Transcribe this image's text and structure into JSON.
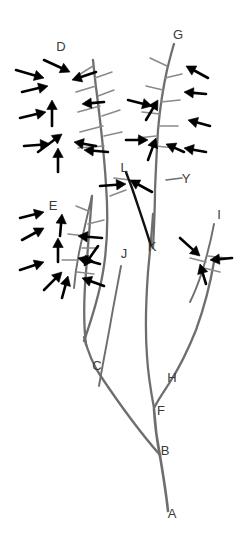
{
  "figure": {
    "background_color": "#ffffff",
    "width": 252,
    "height": 549,
    "stem_color": "#6e6e6e",
    "twig_color": "#8a8a8a",
    "arrow_color": "#000000",
    "highlight_branch_color": "#111111",
    "label_color": "#3a3a3a"
  },
  "labels": [
    {
      "id": "A",
      "text": "A",
      "x": 172,
      "y": 515,
      "description": "base of main stem"
    },
    {
      "id": "B",
      "text": "B",
      "x": 165,
      "y": 452,
      "description": "first branch junction above base"
    },
    {
      "id": "C",
      "text": "C",
      "x": 97,
      "y": 367,
      "description": "junction on left branch"
    },
    {
      "id": "D",
      "text": "D",
      "x": 61,
      "y": 48,
      "description": "apex of upper-left branch cluster"
    },
    {
      "id": "E",
      "text": "E",
      "x": 53,
      "y": 207,
      "description": "apex of lower-left branch cluster"
    },
    {
      "id": "F",
      "text": "F",
      "x": 161,
      "y": 412,
      "description": "junction above B on central stem"
    },
    {
      "id": "G",
      "text": "G",
      "x": 178,
      "y": 36,
      "description": "apex of upper-right branch cluster"
    },
    {
      "id": "H",
      "text": "H",
      "x": 172,
      "y": 379,
      "description": "junction on right branch"
    },
    {
      "id": "I",
      "text": "I",
      "x": 219,
      "y": 216,
      "description": "apex of right short cluster"
    },
    {
      "id": "J",
      "text": "J",
      "x": 124,
      "y": 255,
      "description": "lower tip of free stem"
    },
    {
      "id": "K",
      "text": "K",
      "x": 152,
      "y": 248,
      "description": "origin of highlighted dark branch"
    },
    {
      "id": "L",
      "text": "L",
      "x": 124,
      "y": 169,
      "description": "apex of highlighted dark branch"
    },
    {
      "id": "Y",
      "text": "Y",
      "x": 186,
      "y": 180,
      "description": "tick mark node on right central stem"
    }
  ],
  "stems": [
    {
      "name": "main-stem-A-to-B",
      "d": "M 168 511 C 166 492 163 474 160 456",
      "class": "stem-main"
    },
    {
      "name": "stem-B-to-F",
      "d": "M 160 456 C 157 441 155 426 154 409",
      "class": "stem-main"
    },
    {
      "name": "stem-B-to-C-branch",
      "d": "M 160 455 C 145 438 120 405 100 375 C 92 363 88 352 84 337",
      "class": "stem-major"
    },
    {
      "name": "stem-C-upper-left",
      "d": "M 86 345 C 83 320 84 296 86 272 C 88 248 90 220 92 196",
      "class": "stem-major"
    },
    {
      "name": "stem-C-to-D",
      "d": "M 84 341 C 92 318 99 296 103 272 C 108 243 108 212 106 185 C 104 150 100 120 97 95 C 95 80 94 70 93 60",
      "class": "stem-major"
    },
    {
      "name": "stem-F-to-H-branch",
      "d": "M 154 408 C 159 398 165 390 170 382 C 179 368 188 350 196 330 C 204 308 210 285 214 262",
      "class": "stem-major"
    },
    {
      "name": "stem-F-upper",
      "d": "M 154 408 C 151 392 148 374 147 356 C 145 330 146 300 148 272 C 150 250 152 232 153 214",
      "class": "stem-major"
    },
    {
      "name": "stem-K-to-G",
      "d": "M 153 248 C 154 228 155 208 155 190 C 156 166 157 146 158 130 C 160 108 163 88 167 70 C 170 58 172 50 174 44",
      "class": "stem-major"
    },
    {
      "name": "stem-J-free",
      "d": "M 121 266 C 117 288 113 308 110 326 C 106 348 102 368 99 386",
      "class": "stem-minor"
    },
    {
      "name": "stem-I-short",
      "d": "M 214 224 C 211 240 207 256 202 272 C 198 284 194 294 190 302",
      "class": "stem-minor"
    },
    {
      "name": "stem-E-branch",
      "d": "M 92 196 C 88 212 84 230 80 248 C 77 262 75 276 74 288",
      "class": "stem-minor"
    }
  ],
  "twigs": [
    {
      "name": "twig-d1",
      "d": "M 93 66 L 77 76"
    },
    {
      "name": "twig-d2",
      "d": "M 95 78 L 112 72"
    },
    {
      "name": "twig-d3",
      "d": "M 96 86 L 76 92"
    },
    {
      "name": "twig-d4",
      "d": "M 98 96 L 114 90"
    },
    {
      "name": "twig-d5",
      "d": "M 100 106 L 78 112"
    },
    {
      "name": "twig-d6",
      "d": "M 102 116 L 120 110"
    },
    {
      "name": "twig-d7",
      "d": "M 103 126 L 80 132"
    },
    {
      "name": "twig-d8",
      "d": "M 104 136 L 122 132"
    },
    {
      "name": "twig-d9",
      "d": "M 104 146 L 78 148"
    },
    {
      "name": "twig-g1",
      "d": "M 167 66 L 150 58"
    },
    {
      "name": "twig-g2",
      "d": "M 165 78 L 182 74"
    },
    {
      "name": "twig-g3",
      "d": "M 163 90 L 146 86"
    },
    {
      "name": "twig-g4",
      "d": "M 161 102 L 180 100"
    },
    {
      "name": "twig-g5",
      "d": "M 160 114 L 142 112"
    },
    {
      "name": "twig-g6",
      "d": "M 158 126 L 178 126"
    },
    {
      "name": "twig-g7",
      "d": "M 156 136 L 138 138"
    },
    {
      "name": "twig-g8",
      "d": "M 155 146 L 176 148"
    },
    {
      "name": "twig-e1",
      "d": "M 91 212 L 76 206"
    },
    {
      "name": "twig-e2",
      "d": "M 88 224 L 104 220"
    },
    {
      "name": "twig-e3",
      "d": "M 85 236 L 68 234"
    },
    {
      "name": "twig-e4",
      "d": "M 82 248 L 98 248"
    },
    {
      "name": "twig-e5",
      "d": "M 79 260 L 62 260"
    },
    {
      "name": "twig-e6",
      "d": "M 77 272 L 94 274"
    },
    {
      "name": "twig-i1",
      "d": "M 208 256 L 226 258"
    },
    {
      "name": "twig-i2",
      "d": "M 206 262 L 190 258"
    },
    {
      "name": "twig-i3",
      "d": "M 204 268 L 220 272"
    },
    {
      "name": "twig-l1",
      "d": "M 130 180 L 114 178"
    },
    {
      "name": "twig-l2",
      "d": "M 126 190 L 110 196"
    }
  ],
  "ticks": [
    {
      "name": "tick-y",
      "d": "M 166 180 L 182 178"
    }
  ],
  "highlight_branch": {
    "name": "branch-K-to-L",
    "d": "M 151 246 C 145 226 138 206 132 188 C 129 180 127 175 126 172"
  },
  "arrows": [
    {
      "name": "arrow-d-a",
      "x1": 16,
      "y1": 70,
      "x2": 44,
      "y2": 78
    },
    {
      "name": "arrow-d-b",
      "x1": 44,
      "y1": 60,
      "x2": 70,
      "y2": 72
    },
    {
      "name": "arrow-d-c",
      "x1": 96,
      "y1": 72,
      "x2": 72,
      "y2": 80
    },
    {
      "name": "arrow-d-d",
      "x1": 22,
      "y1": 92,
      "x2": 48,
      "y2": 86
    },
    {
      "name": "arrow-d-e",
      "x1": 104,
      "y1": 102,
      "x2": 82,
      "y2": 104
    },
    {
      "name": "arrow-d-f",
      "x1": 20,
      "y1": 118,
      "x2": 46,
      "y2": 112
    },
    {
      "name": "arrow-d-g",
      "x1": 52,
      "y1": 126,
      "x2": 52,
      "y2": 100
    },
    {
      "name": "arrow-d-h",
      "x1": 38,
      "y1": 152,
      "x2": 62,
      "y2": 134
    },
    {
      "name": "arrow-d-i",
      "x1": 24,
      "y1": 146,
      "x2": 50,
      "y2": 144
    },
    {
      "name": "arrow-d-j",
      "x1": 58,
      "y1": 172,
      "x2": 58,
      "y2": 148
    },
    {
      "name": "arrow-d-k",
      "x1": 96,
      "y1": 146,
      "x2": 74,
      "y2": 142
    },
    {
      "name": "arrow-d-l",
      "x1": 108,
      "y1": 152,
      "x2": 84,
      "y2": 150
    },
    {
      "name": "arrow-g-a",
      "x1": 208,
      "y1": 78,
      "x2": 186,
      "y2": 66
    },
    {
      "name": "arrow-g-b",
      "x1": 206,
      "y1": 94,
      "x2": 184,
      "y2": 92
    },
    {
      "name": "arrow-g-c",
      "x1": 128,
      "y1": 100,
      "x2": 152,
      "y2": 106
    },
    {
      "name": "arrow-g-d",
      "x1": 146,
      "y1": 120,
      "x2": 158,
      "y2": 100
    },
    {
      "name": "arrow-g-e",
      "x1": 210,
      "y1": 126,
      "x2": 188,
      "y2": 120
    },
    {
      "name": "arrow-g-f",
      "x1": 126,
      "y1": 140,
      "x2": 148,
      "y2": 140
    },
    {
      "name": "arrow-g-g",
      "x1": 148,
      "y1": 160,
      "x2": 156,
      "y2": 138
    },
    {
      "name": "arrow-g-h",
      "x1": 206,
      "y1": 152,
      "x2": 184,
      "y2": 148
    },
    {
      "name": "arrow-g-i",
      "x1": 184,
      "y1": 152,
      "x2": 166,
      "y2": 144
    },
    {
      "name": "arrow-e-a",
      "x1": 20,
      "y1": 218,
      "x2": 44,
      "y2": 212
    },
    {
      "name": "arrow-e-b",
      "x1": 60,
      "y1": 236,
      "x2": 62,
      "y2": 214
    },
    {
      "name": "arrow-e-c",
      "x1": 22,
      "y1": 240,
      "x2": 44,
      "y2": 228
    },
    {
      "name": "arrow-e-d",
      "x1": 102,
      "y1": 238,
      "x2": 78,
      "y2": 236
    },
    {
      "name": "arrow-e-e",
      "x1": 58,
      "y1": 262,
      "x2": 58,
      "y2": 238
    },
    {
      "name": "arrow-e-f",
      "x1": 100,
      "y1": 264,
      "x2": 78,
      "y2": 258
    },
    {
      "name": "arrow-e-g",
      "x1": 20,
      "y1": 270,
      "x2": 44,
      "y2": 262
    },
    {
      "name": "arrow-e-h",
      "x1": 98,
      "y1": 246,
      "x2": 84,
      "y2": 266
    },
    {
      "name": "arrow-e-i",
      "x1": 44,
      "y1": 290,
      "x2": 62,
      "y2": 272
    },
    {
      "name": "arrow-e-j",
      "x1": 62,
      "y1": 298,
      "x2": 68,
      "y2": 276
    },
    {
      "name": "arrow-e-k",
      "x1": 104,
      "y1": 286,
      "x2": 82,
      "y2": 278
    },
    {
      "name": "arrow-i-a",
      "x1": 180,
      "y1": 238,
      "x2": 200,
      "y2": 256
    },
    {
      "name": "arrow-i-b",
      "x1": 232,
      "y1": 258,
      "x2": 210,
      "y2": 260
    },
    {
      "name": "arrow-i-c",
      "x1": 206,
      "y1": 284,
      "x2": 200,
      "y2": 264
    },
    {
      "name": "arrow-l-a",
      "x1": 152,
      "y1": 192,
      "x2": 130,
      "y2": 180
    },
    {
      "name": "arrow-l-b",
      "x1": 100,
      "y1": 186,
      "x2": 126,
      "y2": 184
    }
  ]
}
